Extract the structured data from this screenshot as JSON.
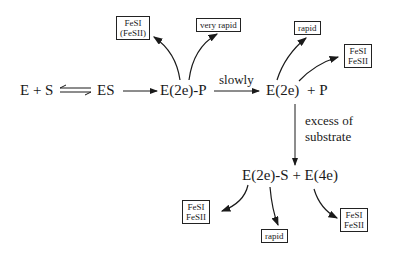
{
  "diagram": {
    "nodes": {
      "es_left": "E + S",
      "es": "ES",
      "e2e_p": "E(2e)-P",
      "e2e": "E(2e)",
      "plus_p": "+ P",
      "e2e_s_e4e": "E(2e)-S + E(4e)"
    },
    "edge_labels": {
      "slowly": "slowly",
      "excess_line1": "excess of",
      "excess_line2": "substrate"
    },
    "boxes": {
      "b1_line1": "FeSI",
      "b1_line2": "(FeSII)",
      "b2": "very rapid",
      "b3": "rapid",
      "b4_line1": "FeSI",
      "b4_line2": "FeSII",
      "b5_line1": "FeSI",
      "b5_line2": "FeSII",
      "b6": "rapid",
      "b7_line1": "FeSI",
      "b7_line2": "FeSII"
    }
  }
}
